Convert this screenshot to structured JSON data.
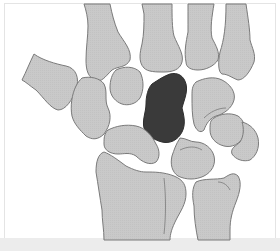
{
  "figure": {
    "description": "Carpal bones of the wrist with the capitate highlighted",
    "colors": {
      "background": "#ffffff",
      "bone_fill": "#c8c8c8",
      "bone_outline": "#7a7a7a",
      "highlight_fill": "#3a3a3a",
      "bottom_band": "#ececec",
      "frame": "#e4e4e4"
    },
    "bones": [
      {
        "id": "metacarpal-1",
        "label": "First metacarpal"
      },
      {
        "id": "metacarpal-2",
        "label": "Second metacarpal"
      },
      {
        "id": "metacarpal-3",
        "label": "Third metacarpal"
      },
      {
        "id": "metacarpal-4",
        "label": "Fourth metacarpal"
      },
      {
        "id": "metacarpal-5",
        "label": "Fifth metacarpal"
      },
      {
        "id": "trapezium",
        "label": "Trapezium"
      },
      {
        "id": "trapezoid",
        "label": "Trapezoid"
      },
      {
        "id": "capitate",
        "label": "Capitate",
        "highlighted": true
      },
      {
        "id": "hamate",
        "label": "Hamate"
      },
      {
        "id": "scaphoid",
        "label": "Scaphoid"
      },
      {
        "id": "lunate",
        "label": "Lunate"
      },
      {
        "id": "triquetrum",
        "label": "Triquetrum"
      },
      {
        "id": "pisiform",
        "label": "Pisiform"
      },
      {
        "id": "radius",
        "label": "Radius"
      },
      {
        "id": "ulna",
        "label": "Ulna"
      }
    ]
  }
}
